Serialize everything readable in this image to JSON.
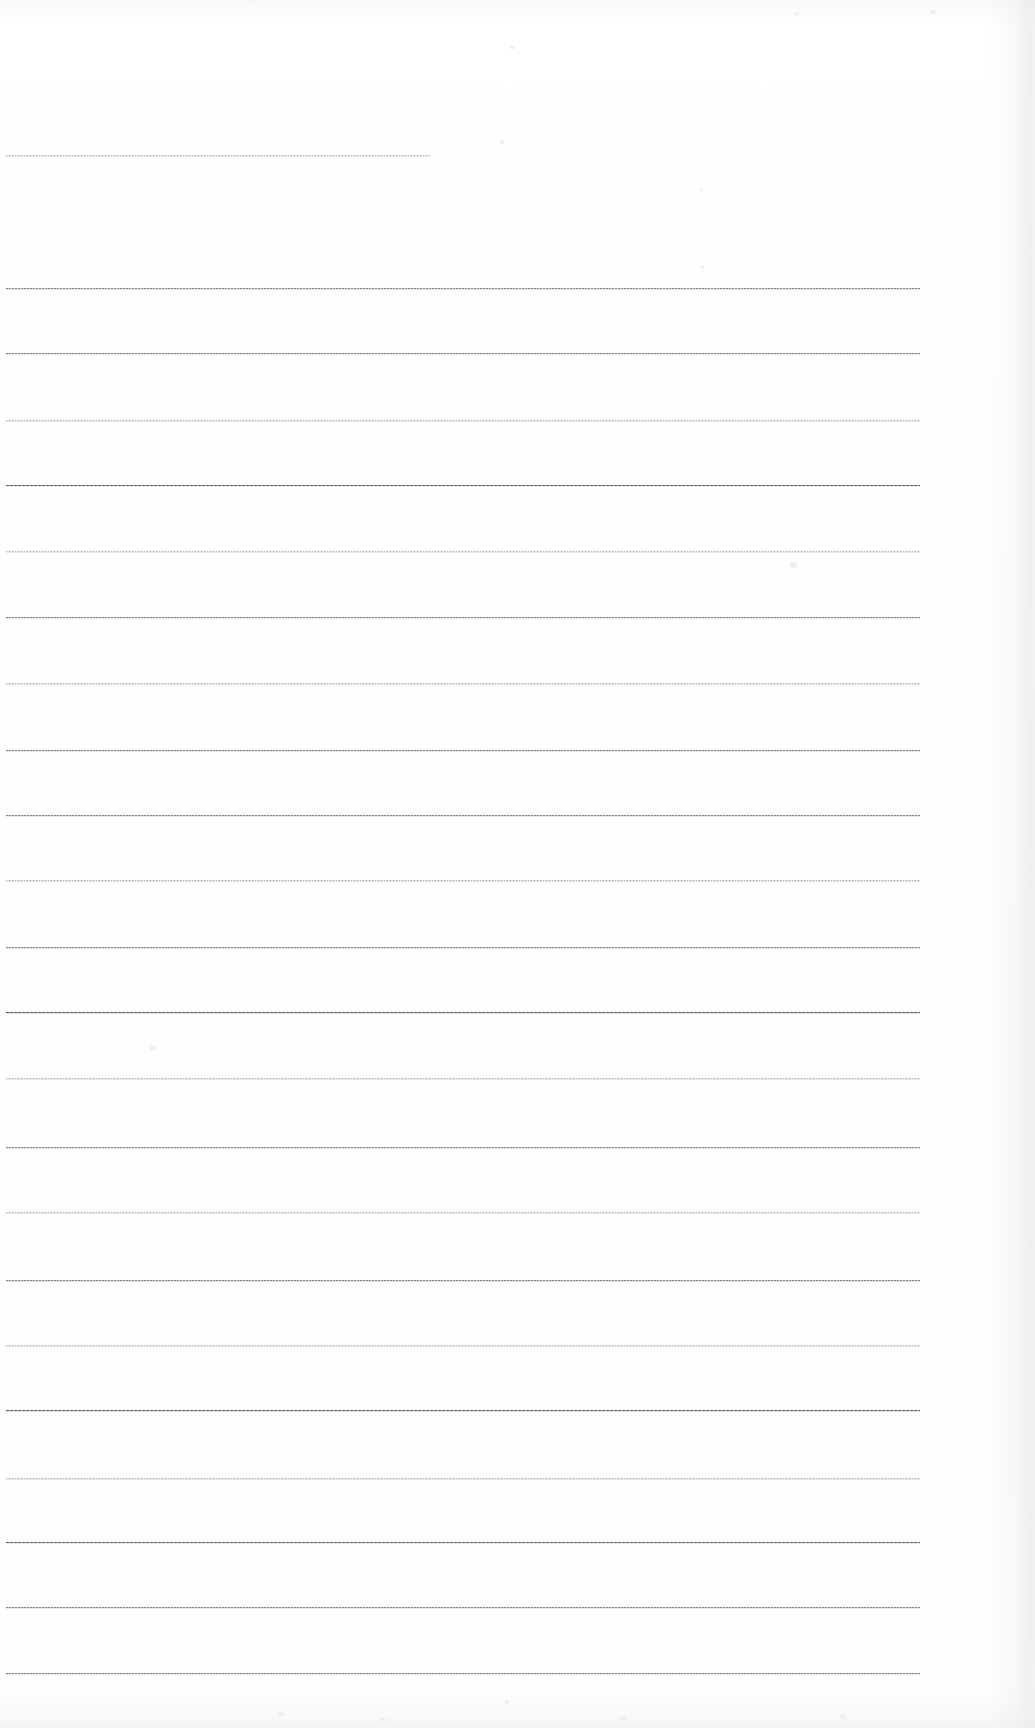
{
  "document": {
    "kind": "scanned-lined-paper",
    "page_width": 1035,
    "page_height": 1728,
    "background_color": "#fefefe",
    "rule_color": "#787880",
    "rule_color_light": "#9696a0",
    "rule_color_dark": "#5c5c63",
    "content_text": "",
    "line_count": 24
  },
  "ruled_lines": [
    {
      "index": 1,
      "y": 155,
      "x": 6,
      "width": 424,
      "weight": "light"
    },
    {
      "index": 2,
      "y": 288,
      "x": 6,
      "width": 914,
      "weight": "normal"
    },
    {
      "index": 3,
      "y": 353,
      "x": 6,
      "width": 914,
      "weight": "normal"
    },
    {
      "index": 4,
      "y": 420,
      "x": 6,
      "width": 914,
      "weight": "light"
    },
    {
      "index": 5,
      "y": 485,
      "x": 6,
      "width": 914,
      "weight": "dark"
    },
    {
      "index": 6,
      "y": 551,
      "x": 6,
      "width": 914,
      "weight": "light"
    },
    {
      "index": 7,
      "y": 617,
      "x": 6,
      "width": 914,
      "weight": "normal"
    },
    {
      "index": 8,
      "y": 683,
      "x": 6,
      "width": 914,
      "weight": "light"
    },
    {
      "index": 9,
      "y": 750,
      "x": 6,
      "width": 914,
      "weight": "normal"
    },
    {
      "index": 10,
      "y": 815,
      "x": 6,
      "width": 914,
      "weight": "normal"
    },
    {
      "index": 11,
      "y": 880,
      "x": 6,
      "width": 914,
      "weight": "light"
    },
    {
      "index": 12,
      "y": 947,
      "x": 6,
      "width": 914,
      "weight": "normal"
    },
    {
      "index": 13,
      "y": 1012,
      "x": 6,
      "width": 914,
      "weight": "dark"
    },
    {
      "index": 14,
      "y": 1078,
      "x": 6,
      "width": 914,
      "weight": "light"
    },
    {
      "index": 15,
      "y": 1147,
      "x": 6,
      "width": 914,
      "weight": "normal"
    },
    {
      "index": 16,
      "y": 1212,
      "x": 6,
      "width": 914,
      "weight": "light"
    },
    {
      "index": 17,
      "y": 1280,
      "x": 6,
      "width": 914,
      "weight": "normal"
    },
    {
      "index": 18,
      "y": 1345,
      "x": 6,
      "width": 914,
      "weight": "light"
    },
    {
      "index": 19,
      "y": 1410,
      "x": 6,
      "width": 914,
      "weight": "dark"
    },
    {
      "index": 20,
      "y": 1478,
      "x": 6,
      "width": 914,
      "weight": "light"
    },
    {
      "index": 21,
      "y": 1542,
      "x": 6,
      "width": 914,
      "weight": "dark"
    },
    {
      "index": 22,
      "y": 1607,
      "x": 6,
      "width": 914,
      "weight": "normal"
    },
    {
      "index": 23,
      "y": 1673,
      "x": 6,
      "width": 914,
      "weight": "normal"
    }
  ],
  "speckles": [
    {
      "x": 510,
      "y": 46,
      "w": 5,
      "h": 3
    },
    {
      "x": 795,
      "y": 12,
      "w": 4,
      "h": 3
    },
    {
      "x": 930,
      "y": 10,
      "w": 6,
      "h": 4
    },
    {
      "x": 500,
      "y": 140,
      "w": 4,
      "h": 4
    },
    {
      "x": 700,
      "y": 188,
      "w": 3,
      "h": 3
    },
    {
      "x": 700,
      "y": 266,
      "w": 5,
      "h": 3
    },
    {
      "x": 790,
      "y": 562,
      "w": 7,
      "h": 6
    },
    {
      "x": 150,
      "y": 1046,
      "w": 6,
      "h": 4
    },
    {
      "x": 505,
      "y": 1700,
      "w": 4,
      "h": 4
    },
    {
      "x": 278,
      "y": 1712,
      "w": 6,
      "h": 4
    },
    {
      "x": 380,
      "y": 1718,
      "w": 5,
      "h": 3
    },
    {
      "x": 620,
      "y": 1716,
      "w": 7,
      "h": 4
    },
    {
      "x": 840,
      "y": 1714,
      "w": 6,
      "h": 5
    }
  ]
}
